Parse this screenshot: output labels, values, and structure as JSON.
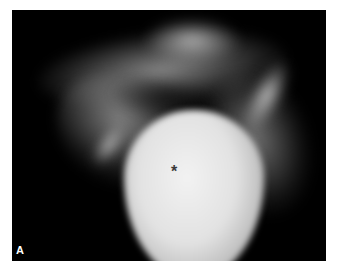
{
  "figure": {
    "panel_label": "A",
    "marker": "*",
    "colors": {
      "background": "#000000",
      "frame": "#ffffff",
      "marker": "#3a3a3a",
      "label": "#ffffff"
    }
  }
}
